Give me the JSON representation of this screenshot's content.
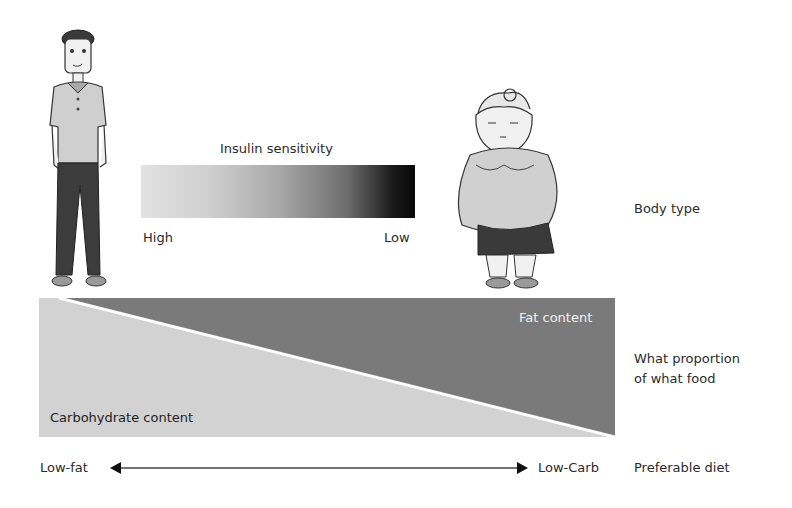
{
  "diagram": {
    "rows": [
      {
        "label": "Body type"
      },
      {
        "label_line1": "What proportion",
        "label_line2": "of what food"
      },
      {
        "label": "Preferable diet"
      }
    ],
    "body_type": {
      "figures": [
        {
          "name": "lean-person",
          "position": "left"
        },
        {
          "name": "obese-person",
          "position": "right"
        }
      ],
      "insulin_sensitivity": {
        "title": "Insulin sensitivity",
        "left_label": "High",
        "right_label": "Low",
        "gradient_colors": [
          "#e2e2e2",
          "#080808"
        ]
      }
    },
    "food_proportion": {
      "fat_label": "Fat content",
      "carb_label": "Carbohydrate content",
      "fat_color": "#7a7a7a",
      "carb_color": "#d2d2d2"
    },
    "diet": {
      "left_label": "Low-fat",
      "right_label": "Low-Carb"
    }
  }
}
